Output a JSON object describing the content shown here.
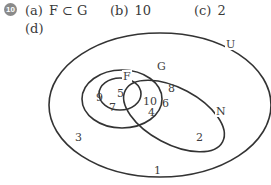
{
  "question": {
    "number": "10",
    "answers": [
      {
        "label": "(a)",
        "value": "F ⊂ G"
      },
      {
        "label": "(b)",
        "value": "10"
      },
      {
        "label": "(c)",
        "value": "2"
      },
      {
        "label": "(d)",
        "value": ""
      }
    ]
  },
  "venn": {
    "sets": {
      "universal": "U",
      "g": "G",
      "f": "F",
      "n": "N"
    },
    "regions": {
      "g_only_left": "9",
      "f_only": "5",
      "f_g_n": "10",
      "g_only_right": "8",
      "g_n": "6",
      "g_only_bottom": "7",
      "g_n_bottom": "4",
      "u_only": "3",
      "n_only": "2",
      "outside_bottom": "1"
    },
    "colors": {
      "stroke": "#333333",
      "badge": "#8a8a8a"
    }
  }
}
